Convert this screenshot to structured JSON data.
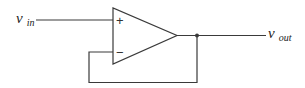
{
  "diagram": {
    "type": "circuit",
    "input_label": {
      "symbol": "v",
      "subscript": "in"
    },
    "output_label": {
      "symbol": "v",
      "subscript": "out"
    },
    "opamp": {
      "plus_sign": "+",
      "minus_sign": "−"
    },
    "connections": [
      "v_in to non-inverting input (+)",
      "op-amp output to v_out",
      "output fed back to inverting input (−)"
    ],
    "color": "#3a3a3a"
  }
}
